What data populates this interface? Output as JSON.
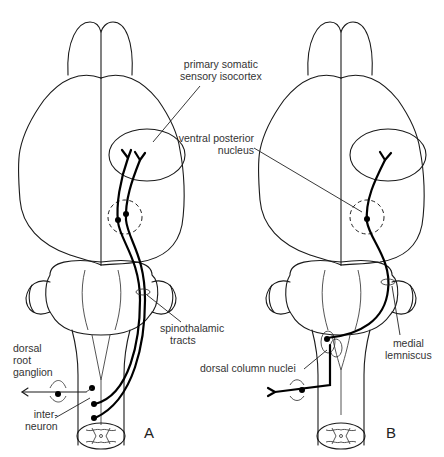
{
  "figure": {
    "panels": [
      {
        "id": "A",
        "label": "A",
        "pathway": "spinothalamic"
      },
      {
        "id": "B",
        "label": "B",
        "pathway": "medial lemniscus"
      }
    ],
    "labels": {
      "primary_somatic_1": "primary somatic",
      "primary_somatic_2": "sensory isocortex",
      "ventral_posterior_1": "ventral posterior",
      "ventral_posterior_2": "nucleus",
      "spinothalamic_1": "spinothalamic",
      "spinothalamic_2": "tracts",
      "dorsal_root_1": "dorsal",
      "dorsal_root_2": "root",
      "dorsal_root_3": "ganglion",
      "interneuron_1": "inter-",
      "interneuron_2": "neuron",
      "dorsal_column_nuclei": "dorsal column nuclei",
      "medial_lemniscus_1": "medial",
      "medial_lemniscus_2": "lemniscus"
    },
    "colors": {
      "line": "#1a1a1a",
      "text": "#333333",
      "background": "#ffffff"
    }
  }
}
